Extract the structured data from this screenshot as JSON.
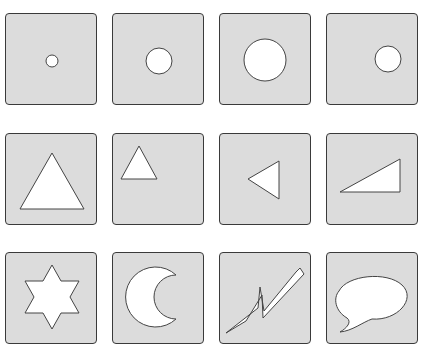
{
  "grid": {
    "rows": 3,
    "columns": 4,
    "tile_fill": "#dcdcdc",
    "tile_border": "#3a3a3a",
    "shape_fill": "#ffffff",
    "shape_stroke": "#444444"
  },
  "tiles": [
    {
      "row": 1,
      "col": 1,
      "shape": "circle",
      "size": "small"
    },
    {
      "row": 1,
      "col": 2,
      "shape": "circle",
      "size": "medium"
    },
    {
      "row": 1,
      "col": 3,
      "shape": "circle",
      "size": "large"
    },
    {
      "row": 1,
      "col": 4,
      "shape": "circle",
      "size": "medium",
      "position": "right"
    },
    {
      "row": 2,
      "col": 1,
      "shape": "triangle",
      "size": "large"
    },
    {
      "row": 2,
      "col": 2,
      "shape": "triangle",
      "size": "small",
      "position": "upper-left"
    },
    {
      "row": 2,
      "col": 3,
      "shape": "triangle",
      "orientation": "pointing-left"
    },
    {
      "row": 2,
      "col": 4,
      "shape": "right-triangle",
      "orientation": "sloped"
    },
    {
      "row": 3,
      "col": 1,
      "shape": "six-pointed-star"
    },
    {
      "row": 3,
      "col": 2,
      "shape": "crescent-moon"
    },
    {
      "row": 3,
      "col": 3,
      "shape": "lightning-bolt"
    },
    {
      "row": 3,
      "col": 4,
      "shape": "speech-bubble"
    }
  ]
}
